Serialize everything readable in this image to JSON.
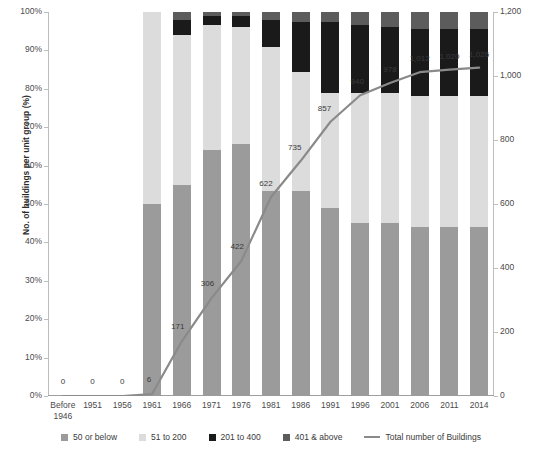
{
  "chart_data": {
    "type": "bar",
    "title": "",
    "subtitle": "",
    "xlabel": "",
    "ylabel": "No. of buildings per unit group (%)",
    "ylabel_right": "",
    "grid": false,
    "legend_position": "bottom",
    "categories": [
      "Before 1946",
      "1951",
      "1956",
      "1961",
      "1966",
      "1971",
      "1976",
      "1981",
      "1986",
      "1991",
      "1996",
      "2001",
      "2006",
      "2011",
      "2014"
    ],
    "ylim": [
      0,
      100
    ],
    "ytick_labels": [
      "0%",
      "10%",
      "20%",
      "30%",
      "40%",
      "50%",
      "60%",
      "70%",
      "80%",
      "90%",
      "100%"
    ],
    "ytick_values": [
      0,
      10,
      20,
      30,
      40,
      50,
      60,
      70,
      80,
      90,
      100
    ],
    "ylim_right": [
      0,
      1200
    ],
    "ytick_labels_right": [
      "0",
      "200",
      "400",
      "600",
      "800",
      "1,000",
      "1,200"
    ],
    "ytick_values_right": [
      0,
      200,
      400,
      600,
      800,
      1000,
      1200
    ],
    "series": [
      {
        "name": "50 or below",
        "color": "#9b9b9b",
        "values": [
          0,
          0,
          0,
          50.0,
          55.0,
          64.0,
          65.5,
          53.5,
          53.5,
          49.0,
          45.0,
          45.0,
          44.0,
          44.0,
          44.0
        ]
      },
      {
        "name": "51 to 200",
        "color": "#dcdcdc",
        "values": [
          0,
          0,
          0,
          50.0,
          39.0,
          32.5,
          30.5,
          37.5,
          31.0,
          30.0,
          34.0,
          34.0,
          34.0,
          34.0,
          34.0
        ]
      },
      {
        "name": "201 to 400",
        "color": "#1a1a1a",
        "values": [
          0,
          0,
          0,
          0,
          4.0,
          2.5,
          3.0,
          7.0,
          13.0,
          18.5,
          17.5,
          17.0,
          17.5,
          17.5,
          17.5
        ]
      },
      {
        "name": "401 & above",
        "color": "#5c5c5c",
        "values": [
          0,
          0,
          0,
          0,
          2.0,
          1.0,
          1.0,
          2.0,
          2.5,
          2.5,
          3.5,
          4.0,
          4.5,
          4.5,
          4.5
        ]
      }
    ],
    "line_series": {
      "name": "Total number of Buildings",
      "color": "#8a8a8a",
      "axis": "right",
      "values": [
        0,
        0,
        0,
        6,
        171,
        306,
        422,
        622,
        735,
        857,
        940,
        978,
        1012,
        1020,
        1026
      ],
      "labels": [
        "0",
        "0",
        "0",
        "6",
        "171",
        "306",
        "422",
        "622",
        "735",
        "857",
        "940",
        "978",
        "1,012",
        "1,020",
        "1,026"
      ]
    }
  },
  "legend": {
    "items": [
      {
        "label": "50 or below",
        "color": "#9b9b9b",
        "kind": "swatch"
      },
      {
        "label": "51 to 200",
        "color": "#dcdcdc",
        "kind": "swatch"
      },
      {
        "label": "201 to 400",
        "color": "#1a1a1a",
        "kind": "swatch"
      },
      {
        "label": "401 & above",
        "color": "#5c5c5c",
        "kind": "swatch"
      },
      {
        "label": "Total number of Buildings",
        "color": "#8a8a8a",
        "kind": "line"
      }
    ]
  }
}
